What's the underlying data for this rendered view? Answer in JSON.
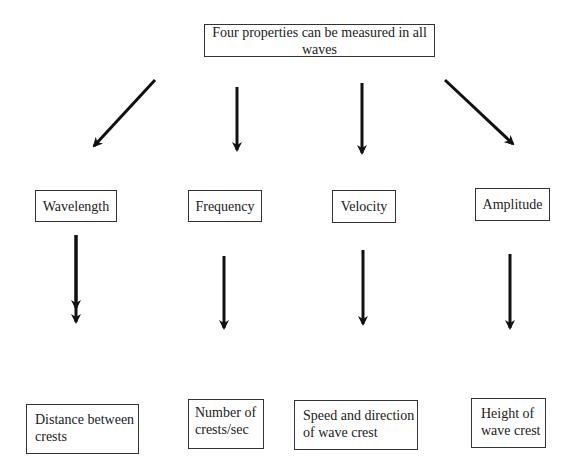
{
  "title": "Four properties can be measured in all waves",
  "properties": [
    {
      "name": "Wavelength",
      "description_line1": "Distance between",
      "description_line2": "crests"
    },
    {
      "name": "Frequency",
      "description_line1": "Number of",
      "description_line2": "crests/sec"
    },
    {
      "name": "Velocity",
      "description_line1": "Speed and direction",
      "description_line2": "of wave crest"
    },
    {
      "name": "Amplitude",
      "description_line1": "Height of",
      "description_line2": "wave crest"
    }
  ],
  "colors": {
    "stroke": "#111111",
    "text": "#222222",
    "background": "#ffffff"
  }
}
